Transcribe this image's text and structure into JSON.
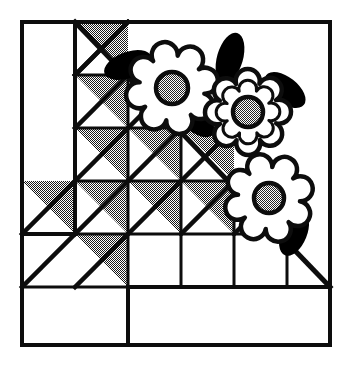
{
  "artwork": {
    "title": "Quilt block pattern illustration",
    "kind": "quilt-block-line-art",
    "block_name": "Staircase half-square triangle block with appliqued flowers",
    "canvas": {
      "width": 355,
      "height": 373
    },
    "colors": {
      "ink": "#0d0d0d",
      "background": "#ffffff",
      "fill_shaded": "#808080",
      "flower_center": "#8c8c8c",
      "leaf": "#000000"
    },
    "border": {
      "label": "outer block border",
      "x": 22,
      "y": 22,
      "width": 308,
      "height": 323,
      "stroke_width": 4
    },
    "grid": {
      "label": "piecing grid",
      "columns": 5,
      "rows": 5,
      "cell_size": 53,
      "origin_x": 22,
      "origin_y": 22,
      "col_x": [
        22,
        75,
        128,
        181,
        234,
        287
      ],
      "row_y": [
        22,
        75,
        128,
        181,
        234,
        287
      ],
      "stroke_width": 3
    },
    "long_diagonal": {
      "label": "main bias diagonal",
      "x1": 75,
      "y1": 22,
      "x2": 330,
      "y2": 287,
      "stroke_width": 5
    },
    "inner_frame_lines": [
      {
        "name": "left-vertical-column-divider",
        "x1": 75,
        "y1": 22,
        "x2": 75,
        "y2": 234
      },
      {
        "name": "lower-left-horizontal",
        "x1": 22,
        "y1": 234,
        "x2": 75,
        "y2": 234
      },
      {
        "name": "bottom-step-vertical",
        "x1": 128,
        "y1": 287,
        "x2": 128,
        "y2": 345
      },
      {
        "name": "bottom-step-horizontal",
        "x1": 128,
        "y1": 287,
        "x2": 330,
        "y2": 287
      }
    ],
    "half_square_triangles": [
      {
        "name": "hst-r1-c2",
        "col": 2,
        "row": 1,
        "shaded": true
      },
      {
        "name": "hst-r2-c2",
        "col": 2,
        "row": 2,
        "shaded": true
      },
      {
        "name": "hst-r2-c3",
        "col": 3,
        "row": 2,
        "shaded": true
      },
      {
        "name": "hst-r3-c2",
        "col": 2,
        "row": 3,
        "shaded": true
      },
      {
        "name": "hst-r3-c3",
        "col": 3,
        "row": 3,
        "shaded": true
      },
      {
        "name": "hst-r3-c4",
        "col": 4,
        "row": 3,
        "shaded": true
      },
      {
        "name": "hst-r4-c1",
        "col": 1,
        "row": 4,
        "shaded": true
      },
      {
        "name": "hst-r4-c2",
        "col": 2,
        "row": 4,
        "shaded": true
      },
      {
        "name": "hst-r4-c3",
        "col": 3,
        "row": 4,
        "shaded": true
      },
      {
        "name": "hst-r4-c4",
        "col": 4,
        "row": 4,
        "shaded": true
      },
      {
        "name": "hst-r4-c5",
        "col": 5,
        "row": 4,
        "shaded": true
      },
      {
        "name": "hst-r5-c2",
        "col": 2,
        "row": 5,
        "shaded": true
      }
    ],
    "plain_triangles": [
      {
        "name": "plain-r1-c2",
        "col": 2,
        "row": 1
      },
      {
        "name": "plain-r5-c2-lower",
        "col": 2,
        "row": 5
      }
    ],
    "flowers": [
      {
        "name": "flower-upper-left",
        "cx": 172,
        "cy": 88,
        "petal_count": 8,
        "outer_radius": 40,
        "petal_radius": 13,
        "center_radius": 16,
        "double_outline": false,
        "rotation": 10
      },
      {
        "name": "flower-upper-right",
        "cx": 248,
        "cy": 112,
        "petal_count": 8,
        "outer_radius": 37,
        "petal_radius": 12,
        "center_radius": 15,
        "double_outline": true,
        "rotation": 22
      },
      {
        "name": "flower-lower-right",
        "cx": 269,
        "cy": 198,
        "petal_count": 8,
        "outer_radius": 38,
        "petal_radius": 12.5,
        "center_radius": 15,
        "double_outline": false,
        "rotation": 6
      }
    ],
    "leaves": [
      {
        "name": "leaf-top-left",
        "cx": 128,
        "cy": 65,
        "rx": 25,
        "ry": 13,
        "rotation": -20
      },
      {
        "name": "leaf-mid-left",
        "cx": 196,
        "cy": 120,
        "rx": 22,
        "ry": 12,
        "rotation": 42
      },
      {
        "name": "leaf-top-right",
        "cx": 230,
        "cy": 58,
        "rx": 13,
        "ry": 26,
        "rotation": 16
      },
      {
        "name": "leaf-right-upper",
        "cx": 285,
        "cy": 90,
        "rx": 24,
        "ry": 13,
        "rotation": 38
      },
      {
        "name": "leaf-lower-right",
        "cx": 294,
        "cy": 233,
        "rx": 13,
        "ry": 24,
        "rotation": 22
      }
    ]
  }
}
